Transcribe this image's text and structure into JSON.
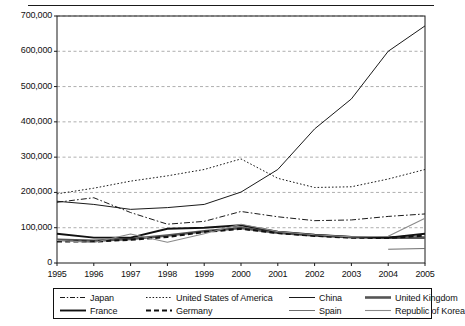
{
  "chart_data": {
    "type": "line",
    "title": "",
    "subtitle": "",
    "xlabel": "",
    "ylabel": "",
    "x": [
      1995,
      1996,
      1997,
      1998,
      1999,
      2000,
      2001,
      2002,
      2003,
      2004,
      2005
    ],
    "categories": [
      "1995",
      "1996",
      "1997",
      "1998",
      "1999",
      "2000",
      "2001",
      "2002",
      "2003",
      "2004",
      "2005"
    ],
    "xlim": [
      1995,
      2005
    ],
    "ylim": [
      0,
      700000
    ],
    "yticks": [
      0,
      100000,
      200000,
      300000,
      400000,
      500000,
      600000,
      700000
    ],
    "ytick_labels": [
      "0",
      "100,000",
      "200,000",
      "300,000",
      "400,000",
      "500,000",
      "600,000",
      "700,000"
    ],
    "grid": "horizontal-dashed",
    "legend_position": "bottom",
    "legend_columns": 4,
    "series": [
      {
        "name": "Japan",
        "style": "dash-dot",
        "width": 1,
        "color": "#1a1a1a",
        "values": [
          172000,
          185000,
          143000,
          110000,
          118000,
          146000,
          131000,
          120000,
          122000,
          132000,
          139000
        ]
      },
      {
        "name": "United States of America",
        "style": "dotted",
        "width": 1,
        "color": "#1a1a1a",
        "values": [
          196000,
          212000,
          232000,
          247000,
          265000,
          295000,
          240000,
          214000,
          216000,
          238000,
          265000
        ]
      },
      {
        "name": "China",
        "style": "solid",
        "width": 1,
        "color": "#1a1a1a",
        "values": [
          175000,
          166000,
          152000,
          157000,
          166000,
          201000,
          265000,
          380000,
          465000,
          600000,
          672000
        ]
      },
      {
        "name": "United Kingdom",
        "style": "solid",
        "width": 2.6,
        "color": "#555555",
        "values": [
          66000,
          63000,
          68000,
          78000,
          90000,
          99000,
          86000,
          78000,
          73000,
          72000,
          72000
        ]
      },
      {
        "name": "France",
        "style": "solid",
        "width": 1.9,
        "color": "#111111",
        "values": [
          83000,
          72000,
          72000,
          97000,
          100000,
          107000,
          89000,
          80000,
          74000,
          72000,
          83000
        ]
      },
      {
        "name": "Germany",
        "style": "dashed",
        "width": 2.2,
        "color": "#111111",
        "values": [
          61000,
          61000,
          66000,
          74000,
          88000,
          97000,
          85000,
          77000,
          72000,
          71000,
          78000
        ]
      },
      {
        "name": "Spain",
        "style": "solid",
        "width": 1,
        "color": "#6e6e6e",
        "values": [
          null,
          null,
          null,
          null,
          null,
          null,
          null,
          null,
          null,
          39000,
          41000
        ]
      },
      {
        "name": "Republic of Korea",
        "style": "solid",
        "width": 1.1,
        "color": "#8a8a8a",
        "values": [
          64000,
          58000,
          82000,
          59000,
          83000,
          110000,
          89000,
          80000,
          74000,
          76000,
          127000
        ]
      }
    ]
  },
  "axes": {
    "y_tick_labels": [
      "700,000",
      "600,000",
      "500,000",
      "400,000",
      "300,000",
      "200,000",
      "100,000",
      "0"
    ],
    "x_tick_labels": [
      "1995",
      "1996",
      "1997",
      "1998",
      "1999",
      "2000",
      "2001",
      "2002",
      "2003",
      "2004",
      "2005"
    ]
  },
  "legend": {
    "entries": [
      {
        "label": "Japan",
        "style": "dash-dot"
      },
      {
        "label": "United States of America",
        "style": "dotted"
      },
      {
        "label": "China",
        "style": "solid-thin"
      },
      {
        "label": "United Kingdom",
        "style": "solid-thick-grey"
      },
      {
        "label": "France",
        "style": "solid-thick"
      },
      {
        "label": "Germany",
        "style": "dashed-thick"
      },
      {
        "label": "Spain",
        "style": "solid-thin-grey"
      },
      {
        "label": "Republic of Korea",
        "style": "solid-thin-lightgrey"
      }
    ]
  }
}
